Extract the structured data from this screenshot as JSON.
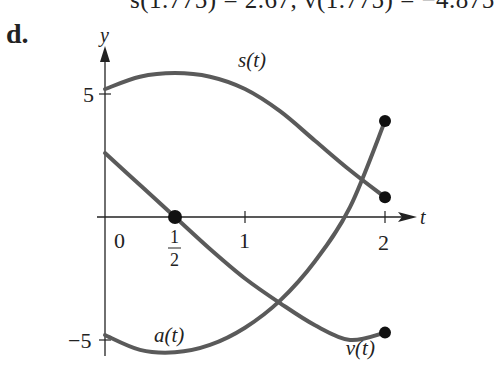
{
  "header": {
    "cut_text": "s(1.775) = 2.67, v(1.775) = −4.875",
    "part_label": "d."
  },
  "colors": {
    "curve": "#5a5a5a",
    "axis": "#222222",
    "dot": "#111111"
  },
  "chart_data": {
    "type": "line",
    "title": "",
    "xlabel": "t",
    "ylabel": "y",
    "xlim": [
      0,
      2
    ],
    "ylim": [
      -5.5,
      6
    ],
    "x_ticks": [
      "0",
      "1/2",
      "1",
      "2"
    ],
    "y_ticks": [
      "5",
      "−5"
    ],
    "grid": false,
    "series": [
      {
        "name": "s(t)",
        "x": [
          0,
          0.25,
          0.5,
          0.75,
          1.0,
          1.25,
          1.5,
          1.75,
          2.0
        ],
        "y": [
          5.2,
          5.7,
          5.85,
          5.7,
          5.2,
          4.3,
          3.1,
          1.9,
          0.8
        ],
        "endpoint_dot": [
          2,
          0.8
        ]
      },
      {
        "name": "v(t)",
        "x": [
          0,
          0.25,
          0.5,
          0.75,
          1.0,
          1.25,
          1.5,
          1.75,
          2.0
        ],
        "y": [
          2.6,
          1.3,
          0,
          -1.3,
          -2.5,
          -3.5,
          -4.4,
          -5.0,
          -4.7
        ],
        "endpoint_dot": [
          2,
          -4.7
        ],
        "marked_point": [
          0.5,
          0
        ]
      },
      {
        "name": "a(t)",
        "x": [
          0,
          0.25,
          0.5,
          0.75,
          1.0,
          1.25,
          1.5,
          1.75,
          2.0
        ],
        "y": [
          -4.8,
          -5.4,
          -5.5,
          -5.2,
          -4.5,
          -3.4,
          -1.8,
          0.4,
          3.9
        ],
        "endpoint_dot": [
          2,
          3.9
        ]
      }
    ],
    "annotations": [
      {
        "text": "s(t)",
        "x": 0.95,
        "y": 6.1
      },
      {
        "text": "a(t)",
        "x": 0.35,
        "y": -5.1
      },
      {
        "text": "v(t)",
        "x": 1.72,
        "y": -5.6
      }
    ]
  }
}
